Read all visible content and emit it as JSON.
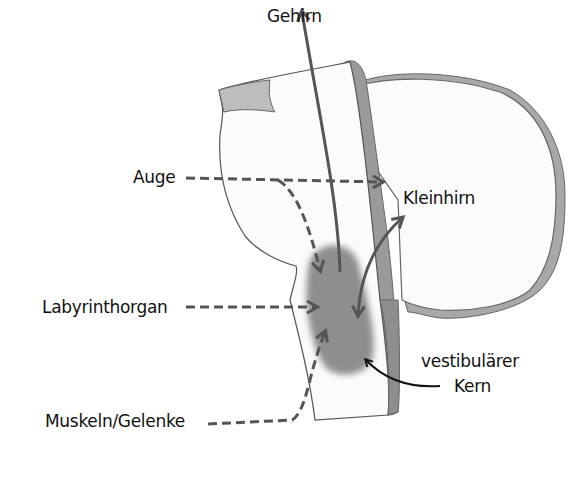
{
  "diagram": {
    "type": "vestibular-pathway-anatomy",
    "colors": {
      "tissue_fill": "#fbfbfb",
      "outline": "#555555",
      "shadow_gray": "#9a9a9a",
      "nucleus_gray": "#8e8e8e",
      "arrow_gray": "#555555",
      "text": "#111111"
    },
    "labels": {
      "brain": "Gehirn",
      "eye": "Auge",
      "cerebellum": "Kleinhirn",
      "labyrinth": "Labyrinthorgan",
      "vestibular_nucleus_line1": "vestibulärer",
      "vestibular_nucleus_line2": "Kern",
      "muscles_joints": "Muskeln/Gelenke"
    },
    "connections": [
      {
        "from": "Auge",
        "to": "Kleinhirn",
        "style": "dashed"
      },
      {
        "from": "Auge",
        "to": "vestibulärer Kern",
        "style": "dashed"
      },
      {
        "from": "Labyrinthorgan",
        "to": "vestibulärer Kern",
        "style": "dashed"
      },
      {
        "from": "Muskeln/Gelenke",
        "to": "vestibulärer Kern",
        "style": "dashed"
      },
      {
        "from": "vestibulärer Kern",
        "to": "Gehirn",
        "style": "solid"
      },
      {
        "from": "vestibulärer Kern",
        "to": "Kleinhirn",
        "style": "solid-bidirectional"
      },
      {
        "from": "label",
        "to": "vestibulärer Kern",
        "style": "pointer"
      }
    ]
  }
}
